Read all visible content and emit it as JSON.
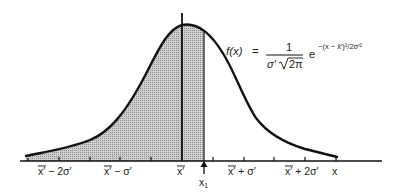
{
  "figure": {
    "type": "normal-distribution-curve",
    "shaded_region": "area under curve from left tail to x1",
    "colors": {
      "curve": "#111111",
      "fill": "#bdbdbd",
      "axis": "#111111",
      "background": "#ffffff"
    }
  },
  "formula": {
    "lhs": "f(x)",
    "equals": "=",
    "numerator": "1",
    "denominator_sigma": "σ′",
    "denominator_sqrt": "2π",
    "base": "e",
    "exponent": "−(x − x̄′)²/2σ′²"
  },
  "axis": {
    "tick_labels": [
      {
        "text": "x̄′ − 2σ′",
        "bar": "x̄"
      },
      {
        "text": "x̄′ − σ′",
        "bar": "x̄"
      },
      {
        "text": "x̄′",
        "bar": "x̄"
      },
      {
        "text": "x̄′ + σ′",
        "bar": "x̄"
      },
      {
        "text": "x̄′ + 2σ′",
        "bar": "x̄"
      }
    ],
    "end_label": "x",
    "marker_label": "x",
    "marker_subscript": "1"
  }
}
